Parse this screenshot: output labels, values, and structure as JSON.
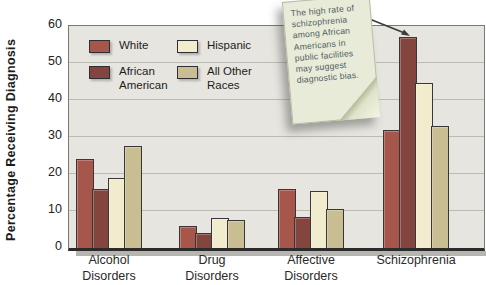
{
  "chart_data": {
    "type": "bar",
    "title": "",
    "xlabel": "",
    "ylabel": "Percentage Receiving Diagnosis",
    "ylim": [
      0,
      60
    ],
    "yticks": [
      0,
      10,
      20,
      30,
      40,
      50,
      60
    ],
    "grid": "horizontal",
    "legend_position": "inside-top-left",
    "categories": [
      "Alcohol Disorders",
      "Drug Disorders",
      "Affective Disorders",
      "Schizophrenia"
    ],
    "category_label_lines": [
      [
        "Alcohol",
        "Disorders"
      ],
      [
        "Drug",
        "Disorders"
      ],
      [
        "Affective",
        "Disorders"
      ],
      [
        "Schizophrenia"
      ]
    ],
    "series": [
      {
        "name": "White",
        "color": "#a7564b",
        "values": [
          24,
          6,
          16,
          32
        ]
      },
      {
        "name": "African American",
        "color": "#84453f",
        "values": [
          16,
          4,
          8.5,
          57
        ]
      },
      {
        "name": "Hispanic",
        "color": "#f1ecce",
        "values": [
          19,
          8,
          15.5,
          44.5
        ]
      },
      {
        "name": "All Other Races",
        "color": "#c9bd92",
        "values": [
          27.5,
          7.5,
          10.5,
          33
        ]
      }
    ]
  },
  "annotation": {
    "text": "The high rate of schizophrenia among African Americans in public facilities may suggest diagnostic bias.",
    "points_to": "African American bar in Schizophrenia group"
  },
  "colors": {
    "plot_background": "#e7e5df",
    "gridline": "#bcbab3",
    "note_background": "#e8ebd8"
  }
}
